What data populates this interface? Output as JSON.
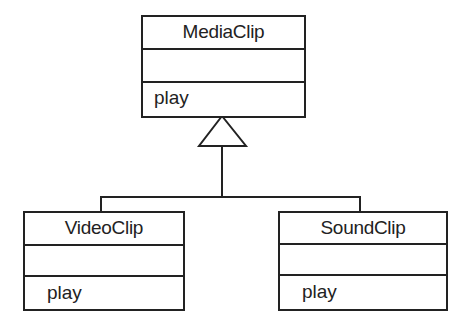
{
  "diagram": {
    "type": "uml-class-diagram",
    "classes": [
      {
        "id": "mediaclip",
        "name": "MediaClip",
        "attributes": [],
        "operations": [
          "play"
        ]
      },
      {
        "id": "videoclip",
        "name": "VideoClip",
        "attributes": [],
        "operations": [
          "play"
        ]
      },
      {
        "id": "soundclip",
        "name": "SoundClip",
        "attributes": [],
        "operations": [
          "play"
        ]
      }
    ],
    "relationships": [
      {
        "type": "generalization",
        "from": "VideoClip",
        "to": "MediaClip"
      },
      {
        "type": "generalization",
        "from": "SoundClip",
        "to": "MediaClip"
      }
    ]
  }
}
